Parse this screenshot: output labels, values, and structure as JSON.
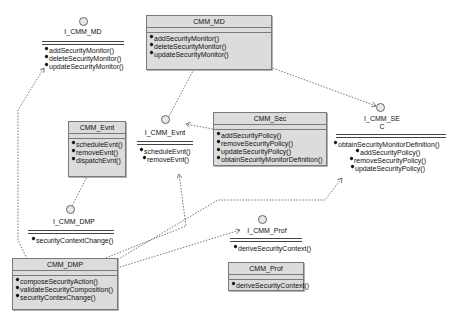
{
  "diagram": {
    "type": "UML component/class diagram",
    "classes": [
      {
        "id": "cmm_md",
        "name": "CMM_MD",
        "operations": [
          "addSecurityMonitor()",
          "deleteSecurityMonitor()",
          "updateSecurityMonitor()"
        ]
      },
      {
        "id": "cmm_sec",
        "name": "CMM_Sec",
        "operations": [
          "addSecurityPolicy()",
          "removeSecurityPolicy()",
          "updateSecurityPolicy()",
          "obtainSecurityMonitorDefinition()"
        ]
      },
      {
        "id": "cmm_evnt",
        "name": "CMM_Evnt",
        "operations": [
          "scheduleEvnt()",
          "removeEvnt()",
          "dispatchEvnt()"
        ]
      },
      {
        "id": "cmm_dmp",
        "name": "CMM_DMP",
        "operations": [
          "composeSecurityAction()",
          "validateSecurityComposition()",
          "securityContexChange()"
        ]
      },
      {
        "id": "cmm_prof",
        "name": "CMM_Prof",
        "operations": [
          "deriveSecurityContext()"
        ]
      }
    ],
    "interfaces": [
      {
        "id": "i_cmm_md",
        "name": "I_CMM_MD",
        "operations": [
          "addSecurityMonitor()",
          "deleteSecurityMonitor()",
          "updateSecurityMonitor()"
        ]
      },
      {
        "id": "i_cmm_evnt",
        "name": "I_CMM_Evnt",
        "operations": [
          "scheduleEvnt()",
          "removeEvnt()"
        ]
      },
      {
        "id": "i_cmm_sec",
        "name_line1": "I_CMM_SE",
        "name_line2": "C",
        "operations": [
          "obtainSecurityMonitorDefinition()",
          "addSecurityPolicy()",
          "removeSecurityPolicy()",
          "updateSecurityPolicy()"
        ]
      },
      {
        "id": "i_cmm_dmp",
        "name": "I_CMM_DMP",
        "operations": [
          "securityContextChange()"
        ]
      },
      {
        "id": "i_cmm_prof",
        "name": "I_CMM_Prof",
        "operations": [
          "deriveSecurityContext()"
        ]
      }
    ],
    "relationships": [
      {
        "from": "CMM_MD",
        "to": "I_CMM_Evnt",
        "style": "dashed"
      },
      {
        "from": "CMM_MD",
        "to": "I_CMM_SEC",
        "style": "dashed-arrow"
      },
      {
        "from": "CMM_Sec",
        "to": "I_CMM_Evnt",
        "style": "dashed-arrow"
      },
      {
        "from": "CMM_Evnt",
        "to": "I_CMM_DMP",
        "style": "dashed"
      },
      {
        "from": "CMM_DMP",
        "to": "I_CMM_MD",
        "style": "dashed-arrow"
      },
      {
        "from": "CMM_DMP",
        "to": "I_CMM_Evnt",
        "style": "dashed-arrow"
      },
      {
        "from": "CMM_DMP",
        "to": "I_CMM_SEC",
        "style": "dashed-arrow"
      },
      {
        "from": "CMM_DMP",
        "to": "I_CMM_Prof",
        "style": "dashed-arrow"
      }
    ]
  }
}
